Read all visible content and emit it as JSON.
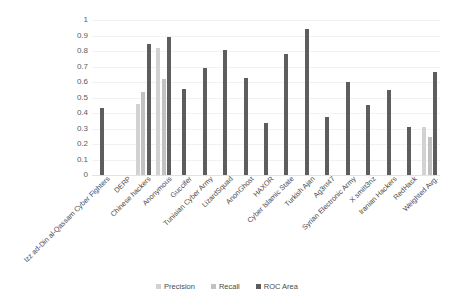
{
  "chart_data": {
    "type": "bar",
    "title": "",
    "xlabel": "",
    "ylabel": "",
    "ylim": [
      0,
      1
    ],
    "ytick_labels": [
      "1",
      "0.9",
      "0.8",
      "0.7",
      "0.6",
      "0.5",
      "0.4",
      "0.3",
      "0.2",
      "0.1",
      "0"
    ],
    "ytick_values": [
      1,
      0.9,
      0.8,
      0.7,
      0.6,
      0.5,
      0.4,
      0.3,
      0.2,
      0.1,
      0
    ],
    "grid": true,
    "legend_position": "bottom",
    "categories": [
      "Izz ad-Din al-Qassam Cyber Fighters",
      "DERP",
      "Chinese hackers",
      "Anonymous",
      "Guccifer",
      "Tunisian Cyber Army",
      "LizardSquad",
      "AnonGhost",
      "HAXOR",
      "Cyber Islamic State",
      "Turkish Ajan",
      "Ag3nt47",
      "Syrian Electronic Army",
      "X smitt3nz",
      "Iranian Hackers",
      "RedHack",
      "Weighted Avg."
    ],
    "series": [
      {
        "name": "Precision",
        "color": "#d2d2d2",
        "values": [
          0,
          0,
          0.46,
          0.82,
          0,
          0,
          0,
          0,
          0,
          0,
          0,
          0,
          0,
          0,
          0,
          0,
          0.31
        ]
      },
      {
        "name": "Recall",
        "color": "#c2c2c2",
        "values": [
          0,
          0,
          0.535,
          0.62,
          0,
          0,
          0,
          0,
          0,
          0,
          0,
          0,
          0,
          0,
          0,
          0,
          0.245
        ]
      },
      {
        "name": "ROC Area",
        "color": "#5d5d5d",
        "values": [
          0.435,
          0,
          0.845,
          0.89,
          0.555,
          0.69,
          0.805,
          0.625,
          0.335,
          0.78,
          0.94,
          0.375,
          0.6,
          0.45,
          0.55,
          0.31,
          0.665
        ]
      }
    ]
  },
  "legend": {
    "items": [
      {
        "label": "Precision",
        "color": "#d2d2d2"
      },
      {
        "label": "Recall",
        "color": "#c2c2c2"
      },
      {
        "label": "ROC Area",
        "color": "#5d5d5d"
      }
    ]
  },
  "title_strip": {
    "text": ""
  }
}
